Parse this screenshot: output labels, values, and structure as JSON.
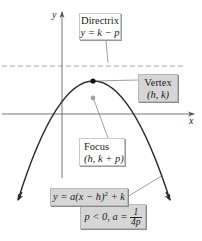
{
  "diagram": {
    "type": "parabola-vertical-opening-down",
    "axes": {
      "x_label": "x",
      "y_label": "y"
    },
    "directrix": {
      "title": "Directrix",
      "equation": "y = k − p"
    },
    "vertex": {
      "title": "Vertex",
      "coords": "(h, k)"
    },
    "focus": {
      "title": "Focus",
      "coords": "(h, k + p)"
    },
    "equation": {
      "lhs": "y = a(x − h)",
      "exponent": "2",
      "rhs": " + k"
    },
    "condition": {
      "text": "p < 0, a = ",
      "frac_num": "1",
      "frac_den": "4p"
    },
    "colors": {
      "curve": "#2a2a2a",
      "axis": "#555555",
      "directrix_line": "#9a9a9a",
      "focus_point": "#9a9a9a",
      "vertex_point": "#111111",
      "gray_box": "#d6d6d6"
    }
  }
}
